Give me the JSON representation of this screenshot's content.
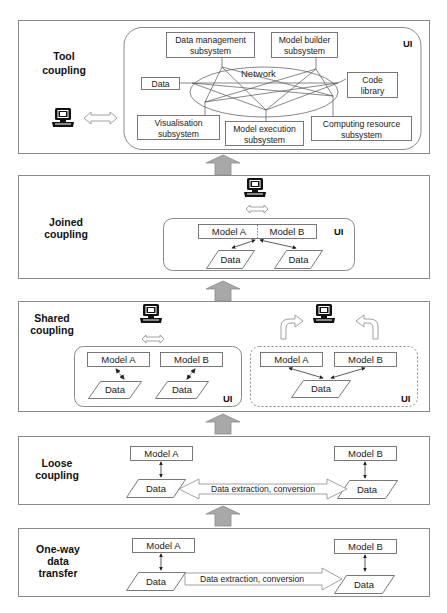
{
  "figure": {
    "levels": [
      {
        "id": "tool",
        "title_lines": [
          "Tool",
          "coupling"
        ],
        "ui_tag": "UI",
        "network_label": "Network",
        "nodes": {
          "data_management": [
            "Data management",
            "subsystem"
          ],
          "model_builder": [
            "Model  builder",
            "subsystem"
          ],
          "data": "Data",
          "code_library": [
            "Code",
            "library"
          ],
          "visualisation": [
            "Visualisation",
            "subsystem"
          ],
          "model_execution": [
            "Model execution",
            "subsystem"
          ],
          "computing_resource": [
            "Computing resource",
            "subsystem"
          ]
        }
      },
      {
        "id": "joined",
        "title_lines": [
          "Joined",
          "coupling"
        ],
        "ui_tag": "UI",
        "model_a": "Model A",
        "model_b": "Model B",
        "data_1": "Data",
        "data_2": "Data"
      },
      {
        "id": "shared",
        "title_lines": [
          "Shared",
          "coupling"
        ],
        "left": {
          "ui_tag": "UI",
          "model_a": "Model A",
          "model_b": "Model B",
          "data_1": "Data",
          "data_2": "Data"
        },
        "right": {
          "ui_tag": "UI",
          "model_a": "Model A",
          "model_b": "Model B",
          "data": "Data"
        }
      },
      {
        "id": "loose",
        "title_lines": [
          "Loose",
          "coupling"
        ],
        "model_a": "Model A",
        "model_b": "Model B",
        "data_a": "Data",
        "data_b": "Data",
        "transfer_label": "Data extraction, conversion"
      },
      {
        "id": "one_way",
        "title_lines": [
          "One-way",
          "data",
          "transfer"
        ],
        "model_a": "Model A",
        "model_b": "Model B",
        "data_a": "Data",
        "data_b": "Data",
        "transfer_label": "Data extraction, conversion"
      }
    ],
    "icons": {
      "computer": "computer-terminal-icon",
      "bidirectional": "hollow-double-arrow-icon",
      "level_up": "grey-up-arrow-icon"
    },
    "colors": {
      "panel_border": "#8a8a8a",
      "up_arrow_fill": "#a8a8a8",
      "text": "#1a1a1a"
    }
  }
}
